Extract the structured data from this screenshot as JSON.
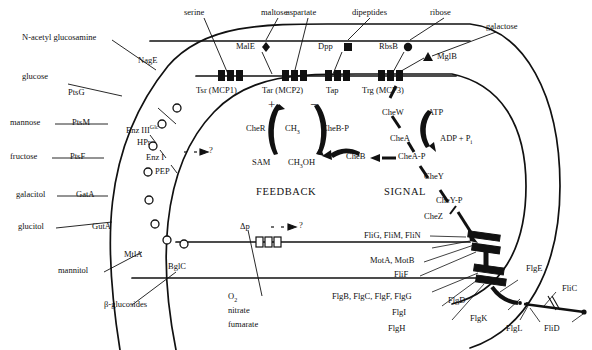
{
  "diagram": {
    "type": "biological-schematic",
    "colors": {
      "ink": "#111111",
      "background": "#ffffff"
    }
  },
  "external_ligands": {
    "n_acetyl_glucosamine": "N-acetyl glucosamine",
    "glucose": "glucose",
    "mannose": "mannose",
    "fructose": "fructose",
    "galacitol": "galacitol",
    "glucitol": "glucitol",
    "mannitol": "mannitol",
    "beta_glucosides": "β-glucosides",
    "serine": "serine",
    "maltose": "maltose",
    "aspartate": "aspartate",
    "dipeptides": "dipeptides",
    "ribose": "ribose",
    "galactose": "galactose"
  },
  "transporters": {
    "nage": "NagE",
    "ptsg": "PtsG",
    "ptsm": "PtsM",
    "ptsf": "PtsF",
    "gata": "GatA",
    "guta": "GutA",
    "mtla": "MtlA",
    "bglc": "BglC"
  },
  "periplasmic_binding_proteins": {
    "male": "MalE",
    "dpp": "Dpp",
    "rbsb": "RbsB",
    "mglb": "MglB",
    "male_marker": "diamond-marker",
    "dpp_marker": "square-marker",
    "rbsb_marker": "circle-marker",
    "mglb_marker": "triangle-marker"
  },
  "receptors": {
    "tsr": "Tsr (MCP1)",
    "tar": "Tar (MCP2)",
    "tap": "Tap",
    "trg": "Trg (MCP3)"
  },
  "pts_cascade": {
    "enz3": "Enz III",
    "enz3_sup": "Glc",
    "hpr": "HPr",
    "enz1": "Enz I",
    "pep": "PEP",
    "question": "?"
  },
  "feedback": {
    "heading": "FEEDBACK",
    "plus": "+",
    "minus": "−",
    "cher": "CheR",
    "ch3": "CH3",
    "ch3_sub": "3",
    "cheb_p": "CheB-P",
    "sam": "SAM",
    "ch3oh": "CH3OH",
    "ch3oh_sub": "3"
  },
  "signal": {
    "heading": "SIGNAL",
    "chew": "CheW",
    "chea": "CheA",
    "atp": "ATP",
    "adp_pi": "ADP + P",
    "adp_pi_sub": "i",
    "chea_p": "CheA-P",
    "cheb": "CheB",
    "chey": "CheY",
    "chey_p": "CheY-P",
    "chez": "CheZ"
  },
  "energy_taxis": {
    "delta_p": "Δp",
    "question": "?",
    "o2": "O",
    "o2_sub": "2",
    "nitrate": "nitrate",
    "fumarate": "fumarate"
  },
  "flagellar_motor": {
    "switch": "FliG, FliM, FliN",
    "stator": "MotA, MotB",
    "ms_ring": "FliF",
    "rod": "FlgB, FlgC, FlgF, FlgG",
    "p_ring": "FlgI",
    "l_ring": "FlgH",
    "hook": "FlgE",
    "hook_cap": "FlgD",
    "junction_k": "FlgK",
    "junction_l": "FlgL",
    "filament": "FliC",
    "filament_cap": "FliD"
  }
}
